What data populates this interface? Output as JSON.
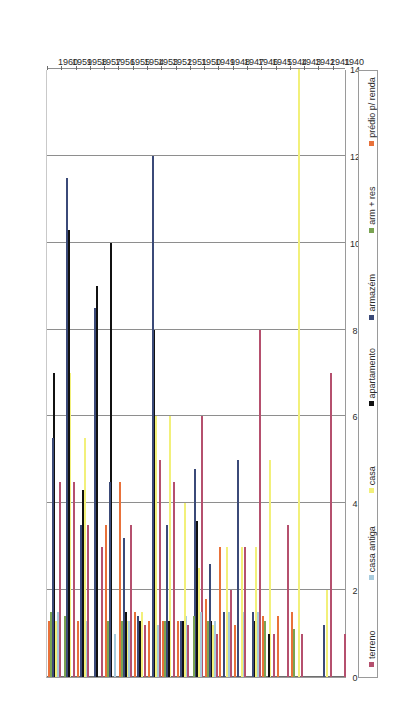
{
  "chart_data": {
    "type": "bar",
    "orientation": "horizontal",
    "title": "",
    "xlabel": "",
    "ylabel": "",
    "xlim": [
      0,
      14
    ],
    "xticks": [
      0,
      2,
      4,
      6,
      8,
      10,
      12,
      14
    ],
    "xtick_labels": [
      "0",
      "2",
      "4",
      "6",
      "8",
      "10",
      "12",
      "14"
    ],
    "grid": true,
    "legend_position": "bottom",
    "categories": [
      "1940",
      "1941",
      "1942",
      "1943",
      "1944",
      "1945",
      "1946",
      "1947",
      "1948",
      "1949",
      "1950",
      "1951",
      "1952",
      "1953",
      "1954",
      "1955",
      "1956",
      "1957",
      "1958",
      "1959",
      "1960"
    ],
    "series": [
      {
        "name": "terreno",
        "color": "#b5506e",
        "values": [
          1,
          7,
          0,
          1,
          3.5,
          1,
          8,
          3,
          2,
          1,
          6,
          1.2,
          4.5,
          5,
          1.2,
          3.5,
          0,
          3,
          3.5,
          4.5,
          4.5
        ]
      },
      {
        "name": "casa antiga",
        "color": "#a8cbdd",
        "values": [
          0,
          0,
          0,
          0,
          0,
          0,
          1.5,
          1.5,
          1.5,
          1.3,
          1.5,
          1.4,
          0,
          1.2,
          0,
          1.3,
          1,
          0,
          1.3,
          0,
          1.5
        ]
      },
      {
        "name": "casa",
        "color": "#f2f07a",
        "values": [
          0,
          2,
          0,
          14,
          0,
          5,
          3,
          3,
          3,
          1.2,
          2.5,
          4,
          6,
          6,
          1.5,
          1.3,
          0,
          0,
          5.5,
          7,
          1.3
        ]
      },
      {
        "name": "apartamento",
        "color": "#111111",
        "values": [
          0,
          0,
          0,
          0,
          0,
          1,
          1.3,
          0,
          0,
          1.3,
          3.6,
          1.3,
          1.3,
          8,
          1.3,
          1.5,
          10,
          9,
          4.3,
          10.3,
          7
        ]
      },
      {
        "name": "armazém",
        "color": "#3b4a78",
        "values": [
          0,
          1.2,
          0,
          0,
          0,
          0,
          1.5,
          5,
          1.5,
          2.6,
          4.8,
          1.3,
          3.5,
          12,
          1.4,
          3.2,
          4.5,
          8.5,
          3.5,
          11.5,
          5.5
        ]
      },
      {
        "name": "arm + res",
        "color": "#7aa352",
        "values": [
          0,
          0,
          0,
          1.1,
          0,
          1.3,
          0,
          0,
          0,
          1.3,
          1.4,
          0,
          1.3,
          0,
          0,
          1.3,
          1.3,
          0,
          0,
          1.4,
          1.5
        ]
      },
      {
        "name": "prédio p/ renda",
        "color": "#e8713a",
        "values": [
          0,
          0,
          0,
          1.5,
          1.4,
          1.4,
          0,
          1.2,
          3,
          1.8,
          0,
          1.3,
          1.3,
          1.3,
          1.5,
          4.5,
          3.5,
          0,
          1.3,
          0,
          1.3
        ]
      }
    ]
  },
  "legend": {
    "items": [
      {
        "label": "terreno",
        "color": "#b5506e"
      },
      {
        "label": "casa antiga",
        "color": "#a8cbdd"
      },
      {
        "label": "casa",
        "color": "#f2f07a"
      },
      {
        "label": "apartamento",
        "color": "#111111"
      },
      {
        "label": "armazém",
        "color": "#3b4a78"
      },
      {
        "label": "arm + res",
        "color": "#7aa352"
      },
      {
        "label": "prédio p/ renda",
        "color": "#e8713a"
      }
    ]
  }
}
